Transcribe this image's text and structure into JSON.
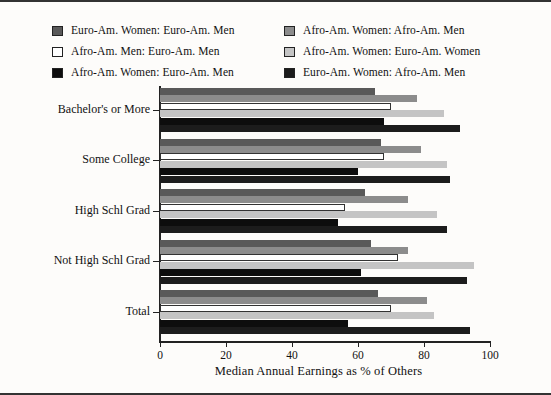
{
  "chart_data": {
    "type": "bar",
    "orientation": "horizontal",
    "title": "",
    "xlabel": "Median Annual Earnings as % of Others",
    "ylabel": "",
    "xlim": [
      0,
      100
    ],
    "xticks": [
      0,
      20,
      40,
      60,
      80,
      100
    ],
    "grid": false,
    "legend_position": "top",
    "categories": [
      "Bachelor's or More",
      "Some College",
      "High Schl Grad",
      "Not High Schl Grad",
      "Total"
    ],
    "series": [
      {
        "name": "Euro-Am. Women: Euro-Am. Men",
        "color": "#595959",
        "values": [
          65,
          67,
          62,
          64,
          66
        ]
      },
      {
        "name": "Afro-Am. Women: Afro-Am. Men",
        "color": "#8c8c8c",
        "values": [
          78,
          79,
          75,
          75,
          81
        ]
      },
      {
        "name": "Afro-Am. Men: Euro-Am. Men",
        "color": "#ffffff",
        "values": [
          70,
          68,
          56,
          72,
          70
        ]
      },
      {
        "name": "Afro-Am. Women: Euro-Am. Women",
        "color": "#c4c4c4",
        "values": [
          86,
          87,
          84,
          95,
          83
        ]
      },
      {
        "name": "Afro-Am. Women: Euro-Am. Men",
        "color": "#0d0d0d",
        "values": [
          68,
          60,
          54,
          61,
          57
        ]
      },
      {
        "name": "Euro-Am. Women: Afro-Am. Men",
        "color": "#1c1c1c",
        "values": [
          91,
          88,
          87,
          93,
          94
        ]
      }
    ]
  },
  "legend": {
    "left_column": [
      {
        "label": "Euro-Am. Women: Euro-Am. Men",
        "color": "#595959"
      },
      {
        "label": "Afro-Am. Men: Euro-Am. Men",
        "color": "#ffffff"
      },
      {
        "label": "Afro-Am. Women: Euro-Am. Men",
        "color": "#0d0d0d"
      }
    ],
    "right_column": [
      {
        "label": "Afro-Am. Women: Afro-Am. Men",
        "color": "#8c8c8c"
      },
      {
        "label": "Afro-Am. Women: Euro-Am. Women",
        "color": "#c4c4c4"
      },
      {
        "label": "Euro-Am. Women: Afro-Am. Men",
        "color": "#1c1c1c"
      }
    ]
  }
}
